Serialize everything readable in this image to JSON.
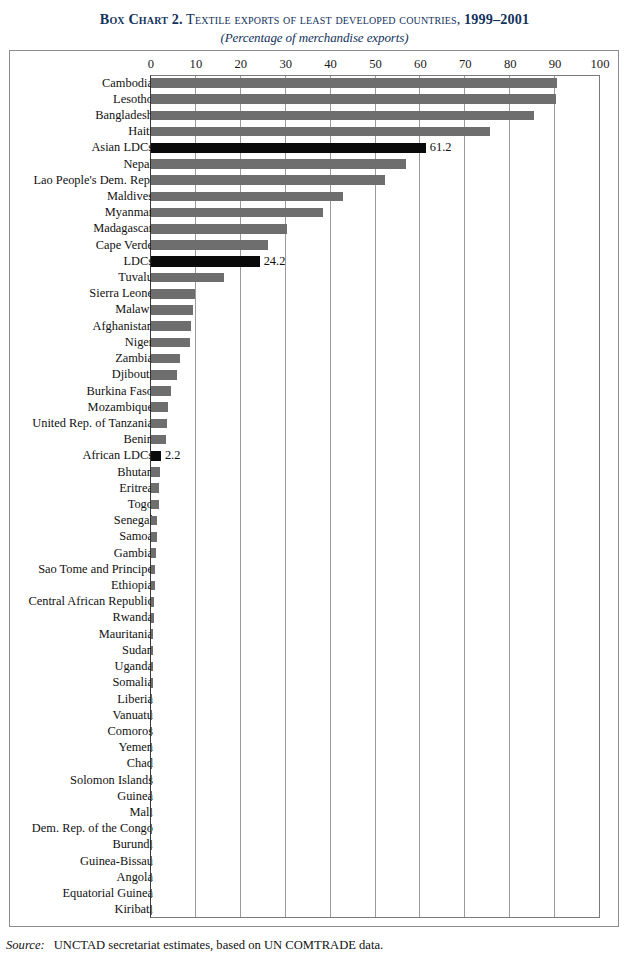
{
  "title": {
    "lead": "Box Chart 2.",
    "caps": "Textile exports of least developed countries,",
    "years": "1999–2001",
    "subtitle": "(Percentage of merchandise exports)"
  },
  "source": {
    "label": "Source:",
    "text": "UNCTAD secretariat estimates, based on UN COMTRADE data."
  },
  "colors": {
    "bar": "#6e6e6e",
    "highlight": "#0a0a0a",
    "grid": "#9a9a9a",
    "frame": "#8d8d8d",
    "title": "#12325c"
  },
  "chart_data": {
    "type": "bar",
    "orientation": "horizontal",
    "title": "Box Chart 2. Textile exports of least developed countries, 1999–2001",
    "subtitle": "(Percentage of merchandise exports)",
    "xlabel": "",
    "ylabel": "",
    "xlim": [
      0,
      100
    ],
    "xticks": [
      0,
      10,
      20,
      30,
      40,
      50,
      60,
      70,
      80,
      90,
      100
    ],
    "grid": true,
    "legend": "none",
    "categories": [
      "Cambodia",
      "Lesotho",
      "Bangladesh",
      "Haiti",
      "Asian LDCs",
      "Nepal",
      "Lao People's Dem. Rep.",
      "Maldives",
      "Myanmar",
      "Madagascar",
      "Cape Verde",
      "LDCs",
      "Tuvalu",
      "Sierra Leone",
      "Malawi",
      "Afghanistan",
      "Niger",
      "Zambia",
      "Djibouti",
      "Burkina Faso",
      "Mozambique",
      "United Rep. of Tanzania",
      "Benin",
      "African LDCs",
      "Bhutan",
      "Eritrea",
      "Togo",
      "Senegal",
      "Samoa",
      "Gambia",
      "Sao Tome and Principe",
      "Ethiopia",
      "Central African Republic",
      "Rwanda",
      "Mauritania",
      "Sudan",
      "Uganda",
      "Somalia",
      "Liberia",
      "Vanuatu",
      "Comoros",
      "Yemen",
      "Chad",
      "Solomon Islands",
      "Guinea",
      "Mali",
      "Dem. Rep. of the Congo",
      "Burundi",
      "Guinea-Bissau",
      "Angola",
      "Equatorial Guinea",
      "Kiribati"
    ],
    "values": [
      90.5,
      90.3,
      85.2,
      75.5,
      61.2,
      56.8,
      52.2,
      42.8,
      38.4,
      30.4,
      26.1,
      24.2,
      16.2,
      9.9,
      9.4,
      8.8,
      8.6,
      6.4,
      5.9,
      4.4,
      3.8,
      3.6,
      3.3,
      2.2,
      1.9,
      1.8,
      1.7,
      1.4,
      1.3,
      1.2,
      0.9,
      0.8,
      0.7,
      0.6,
      0.5,
      0.45,
      0.4,
      0.35,
      0.3,
      0.28,
      0.25,
      0.22,
      0.2,
      0.18,
      0.15,
      0.13,
      0.1,
      0.09,
      0.07,
      0.05,
      0.04,
      0.02
    ],
    "highlighted": [
      "Asian LDCs",
      "LDCs",
      "African LDCs"
    ],
    "labeled_points": [
      {
        "category": "Asian LDCs",
        "label": "61.2"
      },
      {
        "category": "LDCs",
        "label": "24.2"
      },
      {
        "category": "African LDCs",
        "label": "2.2"
      }
    ]
  }
}
